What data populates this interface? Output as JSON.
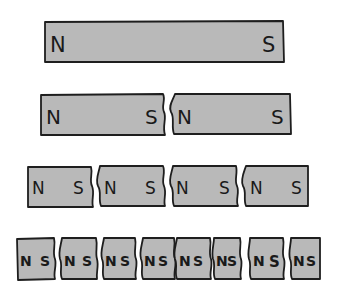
{
  "diagram": {
    "fill_color": "#b9b9b9",
    "stroke_color": "#1e1e1e",
    "rows": [
      {
        "name": "whole-magnet",
        "pieces": [
          {
            "n": "N",
            "s": "S"
          }
        ]
      },
      {
        "name": "halves",
        "pieces": [
          {
            "n": "N",
            "s": "S"
          },
          {
            "n": "N",
            "s": "S"
          }
        ]
      },
      {
        "name": "quarters",
        "pieces": [
          {
            "n": "N",
            "s": "S"
          },
          {
            "n": "N",
            "s": "S"
          },
          {
            "n": "N",
            "s": "S"
          },
          {
            "n": "N",
            "s": "S"
          }
        ]
      },
      {
        "name": "eighths",
        "pieces": [
          {
            "n": "N",
            "s": "S"
          },
          {
            "n": "N",
            "s": "S"
          },
          {
            "n": "N",
            "s": "S"
          },
          {
            "n": "N",
            "s": "S"
          },
          {
            "n": "N",
            "s": "S"
          },
          {
            "n": "N",
            "s": "S"
          },
          {
            "n": "N",
            "s": "S"
          },
          {
            "n": "N",
            "s": "S"
          }
        ]
      }
    ]
  }
}
